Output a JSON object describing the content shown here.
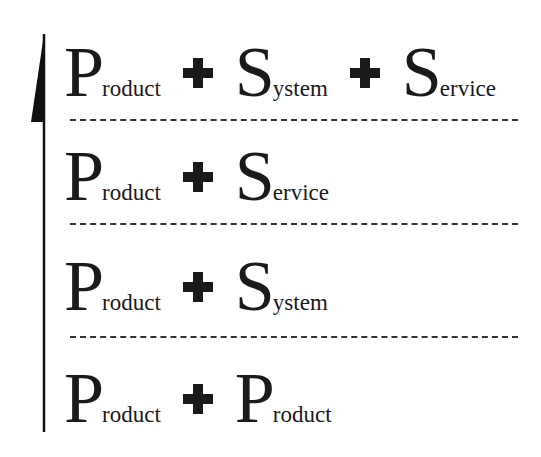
{
  "diagram": {
    "type": "hierarchy-levels",
    "arrow_direction": "up",
    "rows": [
      {
        "level": 4,
        "terms": [
          {
            "initial": "P",
            "rest": "roduct"
          },
          {
            "initial": "S",
            "rest": "ystem"
          },
          {
            "initial": "S",
            "rest": "ervice"
          }
        ],
        "operator": "+"
      },
      {
        "level": 3,
        "terms": [
          {
            "initial": "P",
            "rest": "roduct"
          },
          {
            "initial": "S",
            "rest": "ervice"
          }
        ],
        "operator": "+"
      },
      {
        "level": 2,
        "terms": [
          {
            "initial": "P",
            "rest": "roduct"
          },
          {
            "initial": "S",
            "rest": "ystem"
          }
        ],
        "operator": "+"
      },
      {
        "level": 1,
        "terms": [
          {
            "initial": "P",
            "rest": "roduct"
          },
          {
            "initial": "P",
            "rest": "roduct"
          }
        ],
        "operator": "+"
      }
    ]
  },
  "colors": {
    "ink": "#1a1a1a",
    "background": "#ffffff"
  }
}
